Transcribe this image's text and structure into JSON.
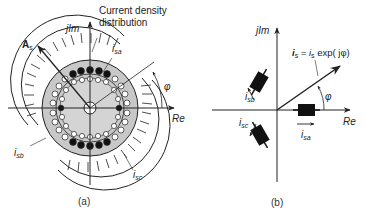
{
  "figure": {
    "panel_a": {
      "caption": "(a)",
      "axis_imag": "jIm",
      "axis_real": "Re",
      "annotation": "Current density distribution",
      "annotation_line1": "Current density",
      "annotation_line2": "distribution",
      "vector_label": "A",
      "vector_sub": "s",
      "angle_label": "φ",
      "phase_labels": {
        "a": {
          "main": "i",
          "sub": "sa"
        },
        "b": {
          "main": "i",
          "sub": "sb"
        },
        "c": {
          "main": "i",
          "sub": "sc"
        }
      }
    },
    "panel_b": {
      "caption": "(b)",
      "axis_imag": "jIm",
      "axis_real": "Re",
      "equation": "i_s = i_s exp( jφ)",
      "eq_lhs": "i",
      "eq_lhs_sub": "s",
      "eq_mid": " = i",
      "eq_mid_sub": "s",
      "eq_rhs": " exp( jφ)",
      "angle_label": "φ",
      "phase_labels": {
        "a": {
          "main": "i",
          "sub": "sa"
        },
        "b": {
          "main": "i",
          "sub": "sb"
        },
        "c": {
          "main": "i",
          "sub": "sc"
        }
      }
    },
    "colors": {
      "stroke": "#222222",
      "stator_fill": "#c8c8c8",
      "conductor_open": "#ffffff",
      "conductor_filled": "#111111"
    }
  }
}
